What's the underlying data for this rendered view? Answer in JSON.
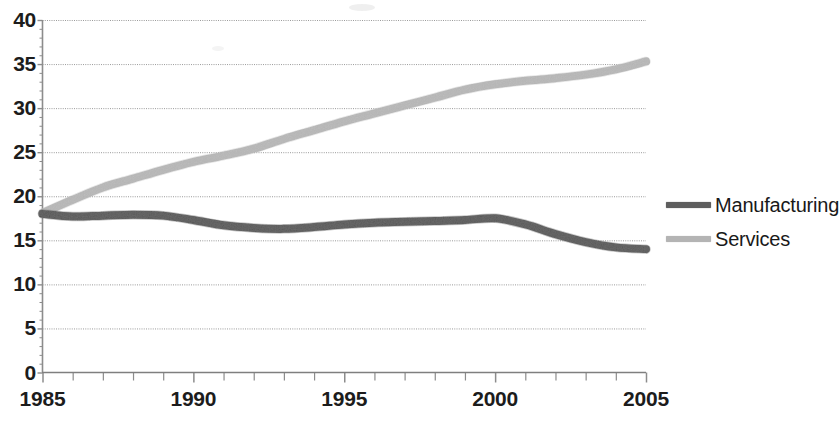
{
  "chart_data": {
    "type": "line",
    "title": "",
    "subtitle": "",
    "xlabel": "",
    "ylabel": "",
    "xlim": [
      1985,
      2005
    ],
    "ylim": [
      0,
      40
    ],
    "ytick_values": [
      0,
      5,
      10,
      15,
      20,
      25,
      30,
      35,
      40
    ],
    "ytick_labels": [
      "0",
      "5",
      "10",
      "15",
      "20",
      "25",
      "30",
      "35",
      "40"
    ],
    "xtick_values": [
      1985,
      1990,
      1995,
      2000,
      2005
    ],
    "xtick_labels": [
      "1985",
      "1990",
      "1995",
      "2000",
      "2005"
    ],
    "minor_xticks_every": 1,
    "grid": "horizontal-dotted",
    "legend_position": "right",
    "x": [
      1985,
      1986,
      1987,
      1988,
      1989,
      1990,
      1991,
      1992,
      1993,
      1994,
      1995,
      1996,
      1997,
      1998,
      1999,
      2000,
      2001,
      2002,
      2003,
      2004,
      2005
    ],
    "series": [
      {
        "name": "Manufacturing",
        "color": "#5e5e5e",
        "values": [
          18.0,
          17.7,
          17.8,
          17.9,
          17.8,
          17.3,
          16.7,
          16.4,
          16.3,
          16.5,
          16.8,
          17.0,
          17.1,
          17.2,
          17.3,
          17.5,
          16.8,
          15.7,
          14.8,
          14.2,
          14.0
        ]
      },
      {
        "name": "Services",
        "color": "#b4b4b4",
        "values": [
          18.1,
          19.6,
          21.0,
          22.0,
          23.0,
          23.9,
          24.6,
          25.4,
          26.5,
          27.5,
          28.5,
          29.4,
          30.3,
          31.2,
          32.1,
          32.7,
          33.1,
          33.4,
          33.8,
          34.4,
          35.3
        ]
      }
    ]
  },
  "axes": {
    "axis_color": "#8c8c8c",
    "grid_color": "#9a9a9a",
    "tick_color": "#8c8c8c",
    "label_color": "#1c1c1c"
  },
  "legend": {
    "items": [
      {
        "label": "Manufacturing",
        "color": "#5e5e5e"
      },
      {
        "label": "Services",
        "color": "#b4b4b4"
      }
    ]
  }
}
